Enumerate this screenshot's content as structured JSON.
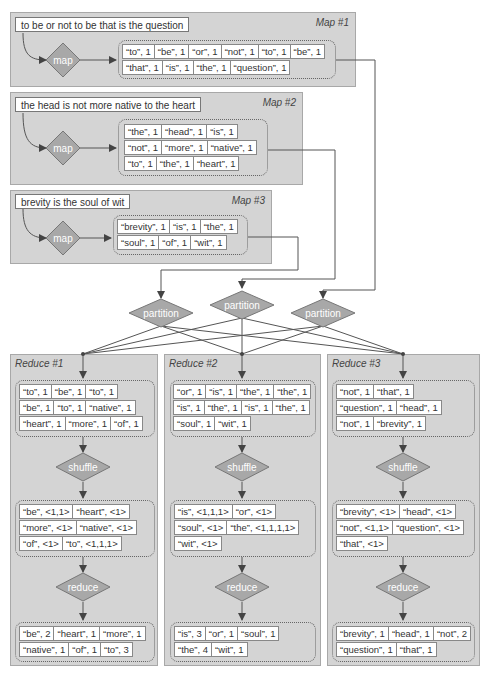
{
  "colors": {
    "panel_bg": "#d4d4d4",
    "diamond_fill": "#a8a8a8",
    "line": "#555555"
  },
  "maps": [
    {
      "title": "Map #1",
      "input": "to be or not to be that is the question",
      "op": "map",
      "rows": [
        [
          "“to”, 1",
          "“be”, 1",
          "“or”, 1",
          "“not”, 1",
          "“to”, 1",
          "“be”, 1"
        ],
        [
          "“that”, 1",
          "“is”, 1",
          "“the”, 1",
          "“question”, 1"
        ]
      ]
    },
    {
      "title": "Map #2",
      "input": "the head is not more native to the heart",
      "op": "map",
      "rows": [
        [
          "“the”, 1",
          "“head”, 1",
          "“is”, 1"
        ],
        [
          "“not”, 1",
          "“more”, 1",
          "“native”, 1"
        ],
        [
          "“to”, 1",
          "“the”, 1",
          "“heart”, 1"
        ]
      ]
    },
    {
      "title": "Map #3",
      "input": "brevity is the soul of wit",
      "op": "map",
      "rows": [
        [
          "“brevity”, 1",
          "“is”, 1",
          "“the”, 1"
        ],
        [
          "“soul”, 1",
          "“of”, 1",
          "“wit”, 1"
        ]
      ]
    }
  ],
  "partitions": [
    "partition",
    "partition",
    "partition"
  ],
  "reduces": [
    {
      "title": "Reduce #1",
      "input_rows": [
        [
          "“to”, 1",
          "“be”, 1",
          "“to”, 1"
        ],
        [
          "“be”, 1",
          "“to”, 1",
          "“native”, 1"
        ],
        [
          "“heart”, 1",
          "“more”, 1",
          "“of”, 1"
        ]
      ],
      "shuffle_label": "shuffle",
      "shuffle_rows": [
        [
          "“be”, <1,1>",
          "“heart”, <1>"
        ],
        [
          "“more”, <1>",
          "“native”, <1>"
        ],
        [
          "“of”, <1>",
          "“to”, <1,1,1>"
        ]
      ],
      "reduce_label": "reduce",
      "output_rows": [
        [
          "“be”, 2",
          "“heart”, 1",
          "“more”, 1"
        ],
        [
          "“native”, 1",
          "“of”, 1",
          "“to”, 3"
        ]
      ]
    },
    {
      "title": "Reduce #2",
      "input_rows": [
        [
          "“or”, 1",
          "“is”, 1",
          "“the”, 1",
          "“the”, 1"
        ],
        [
          "“is”, 1",
          "“the”, 1",
          "“is”, 1",
          "“the”, 1"
        ],
        [
          "“soul”, 1",
          "“wit”, 1"
        ]
      ],
      "shuffle_label": "shuffle",
      "shuffle_rows": [
        [
          "“is”, <1,1,1>",
          "“or”, <1>"
        ],
        [
          "“soul”, <1>",
          "“the”, <1,1,1,1>"
        ],
        [
          "“wit”, <1>"
        ]
      ],
      "reduce_label": "reduce",
      "output_rows": [
        [
          "“is”, 3",
          "“or”, 1",
          "“soul”, 1"
        ],
        [
          "“the”, 4",
          "“wit”, 1"
        ]
      ]
    },
    {
      "title": "Reduce #3",
      "input_rows": [
        [
          "“not”, 1",
          "“that”, 1"
        ],
        [
          "“question”, 1",
          "“head”, 1"
        ],
        [
          "“not”, 1",
          "“brevity”, 1"
        ]
      ],
      "shuffle_label": "shuffle",
      "shuffle_rows": [
        [
          "“brevity”, <1>",
          "“head”, <1>"
        ],
        [
          "“not”, <1,1>",
          "“question”, <1>"
        ],
        [
          "“that”, <1>"
        ]
      ],
      "reduce_label": "reduce",
      "output_rows": [
        [
          "“brevity”, 1",
          "“head”, 1",
          "“not”, 2"
        ],
        [
          "“question”, 1",
          "“that”, 1"
        ]
      ]
    }
  ]
}
